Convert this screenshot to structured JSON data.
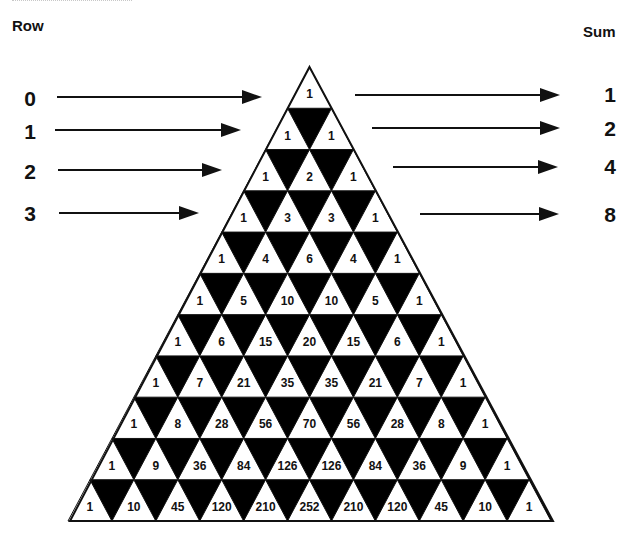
{
  "headers": {
    "row": "Row",
    "sum": "Sum"
  },
  "triangle": {
    "apex": [
      309.5,
      67
    ],
    "base_y": 521,
    "left_x": 70,
    "right_x": 553,
    "rows": [
      [
        1
      ],
      [
        1,
        1
      ],
      [
        1,
        2,
        1
      ],
      [
        1,
        3,
        3,
        1
      ],
      [
        1,
        4,
        6,
        4,
        1
      ],
      [
        1,
        5,
        10,
        10,
        5,
        1
      ],
      [
        1,
        6,
        15,
        20,
        15,
        6,
        1
      ],
      [
        1,
        7,
        21,
        35,
        35,
        21,
        7,
        1
      ],
      [
        1,
        8,
        28,
        56,
        70,
        56,
        28,
        8,
        1
      ],
      [
        1,
        9,
        36,
        84,
        126,
        126,
        84,
        36,
        9,
        1
      ],
      [
        1,
        10,
        45,
        120,
        210,
        252,
        210,
        120,
        45,
        10,
        1
      ]
    ],
    "fill_color": "#000000",
    "cell_color": "#ffffff"
  },
  "row_arrows": [
    {
      "label": "0",
      "label_x": 30,
      "label_y": 106,
      "x1": 57,
      "x2": 262,
      "y": 97
    },
    {
      "label": "1",
      "label_x": 30,
      "label_y": 139,
      "x1": 55,
      "x2": 241,
      "y": 130
    },
    {
      "label": "2",
      "label_x": 30,
      "label_y": 179,
      "x1": 58,
      "x2": 222,
      "y": 170
    },
    {
      "label": "3",
      "label_x": 30,
      "label_y": 221,
      "x1": 59,
      "x2": 199,
      "y": 213
    }
  ],
  "sum_arrows": [
    {
      "label": "1",
      "label_x": 610,
      "label_y": 102,
      "x1": 355,
      "x2": 560,
      "y": 95
    },
    {
      "label": "2",
      "label_x": 610,
      "label_y": 136,
      "x1": 372,
      "x2": 560,
      "y": 128
    },
    {
      "label": "4",
      "label_x": 610,
      "label_y": 174,
      "x1": 393,
      "x2": 558,
      "y": 167
    },
    {
      "label": "8",
      "label_x": 610,
      "label_y": 222,
      "x1": 420,
      "x2": 559,
      "y": 214
    }
  ]
}
